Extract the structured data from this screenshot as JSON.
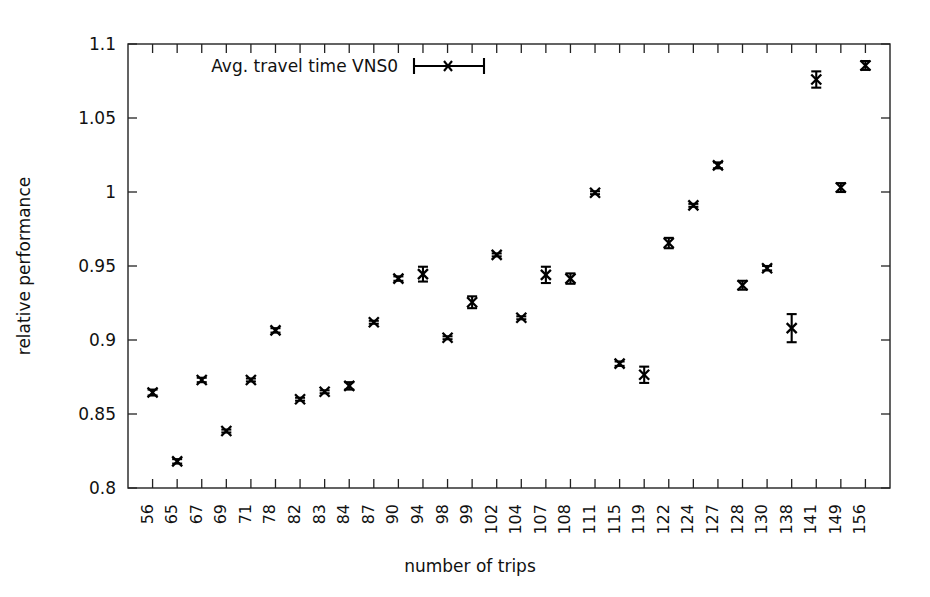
{
  "figure": {
    "background": "#ffffff",
    "ink_color": "#111111"
  },
  "chart_data": {
    "type": "scatter",
    "title": "",
    "xlabel": "number of trips",
    "ylabel": "relative performance",
    "ylim": [
      0.8,
      1.1
    ],
    "ytick_labels": [
      "0.8",
      "0.85",
      "0.9",
      "0.95",
      "1",
      "1.05",
      "1.1"
    ],
    "ytick_values": [
      0.8,
      0.85,
      0.9,
      0.95,
      1.0,
      1.05,
      1.1
    ],
    "grid": false,
    "legend": {
      "entries": [
        {
          "label": "Avg. travel time VNS0",
          "marker": "error-bar-cross"
        }
      ],
      "position": "top-left-inside"
    },
    "categories": [
      "56",
      "65",
      "67",
      "69",
      "71",
      "78",
      "82",
      "83",
      "84",
      "87",
      "90",
      "94",
      "98",
      "99",
      "102",
      "104",
      "107",
      "108",
      "111",
      "115",
      "119",
      "122",
      "124",
      "127",
      "128",
      "130",
      "138",
      "141",
      "149",
      "156"
    ],
    "series": [
      {
        "name": "Avg. travel time VNS0",
        "values": [
          0.8645,
          0.818,
          0.873,
          0.8385,
          0.873,
          0.9065,
          0.86,
          0.865,
          0.869,
          0.912,
          0.9415,
          0.9445,
          0.9015,
          0.9255,
          0.9575,
          0.915,
          0.944,
          0.9415,
          0.9995,
          0.884,
          0.8765,
          0.9655,
          0.991,
          1.018,
          0.937,
          0.9485,
          0.908,
          1.076,
          1.003,
          1.0855
        ],
        "err_low": [
          0.8625,
          0.8165,
          0.8715,
          0.8375,
          0.872,
          0.905,
          0.859,
          0.864,
          0.8665,
          0.911,
          0.94,
          0.9395,
          0.9005,
          0.9215,
          0.9565,
          0.914,
          0.9385,
          0.938,
          0.9985,
          0.8825,
          0.871,
          0.962,
          0.99,
          1.016,
          0.934,
          0.947,
          0.8985,
          1.0705,
          1.0,
          1.0825
        ],
        "err_high": [
          0.8665,
          0.8195,
          0.8745,
          0.8395,
          0.874,
          0.908,
          0.861,
          0.866,
          0.8715,
          0.913,
          0.943,
          0.9495,
          0.9025,
          0.9295,
          0.9585,
          0.916,
          0.9495,
          0.945,
          1.0005,
          0.8855,
          0.882,
          0.969,
          0.992,
          1.02,
          0.94,
          0.95,
          0.9175,
          1.0815,
          1.006,
          1.0885
        ]
      }
    ]
  }
}
